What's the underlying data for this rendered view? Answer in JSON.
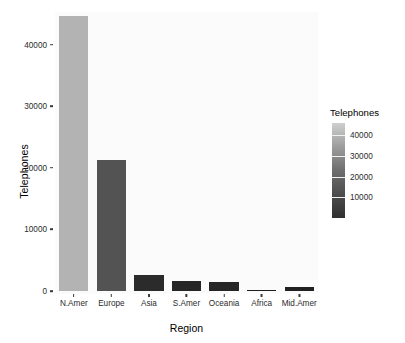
{
  "chart_data": {
    "type": "bar",
    "title": "",
    "subtitle": "",
    "xlabel": "Region",
    "ylabel": "Telephones",
    "categories": [
      "N.Amer",
      "Europe",
      "Asia",
      "S.Amer",
      "Oceania",
      "Africa",
      "Mid.Amer"
    ],
    "values": [
      44700,
      21300,
      2580,
      1610,
      1450,
      160,
      650
    ],
    "bar_colors": [
      "#b3b3b3",
      "#535353",
      "#2b2b2b",
      "#262626",
      "#262626",
      "#1e1e1e",
      "#212121"
    ],
    "ylim": [
      0,
      45000
    ],
    "xlim_type": "categorical",
    "ytick_labels": [
      "0",
      "10000",
      "20000",
      "30000",
      "40000"
    ],
    "ytick_values": [
      0,
      10000,
      20000,
      30000,
      40000
    ],
    "grid": false,
    "panel_background": "#fbfbfb",
    "legend": {
      "title": "Telephones",
      "position": "right",
      "type": "colorbar",
      "tick_labels": [
        "40000",
        "30000",
        "20000",
        "10000"
      ],
      "tick_values": [
        40000,
        30000,
        20000,
        10000
      ],
      "scale_min": 0,
      "scale_max": 46000,
      "gradient_low_color": "#303030",
      "gradient_high_color": "#d9d9d9"
    }
  }
}
